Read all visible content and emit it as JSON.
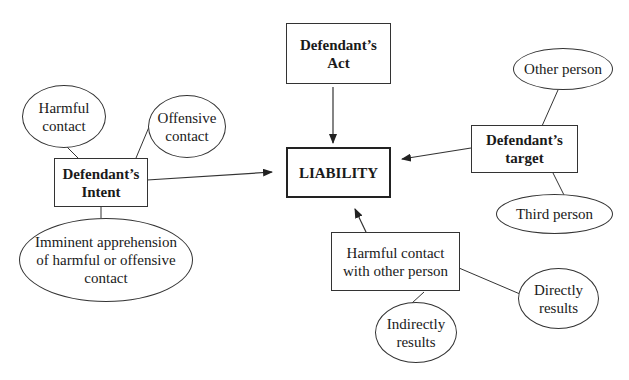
{
  "diagram": {
    "center": {
      "label": "LIABILITY"
    },
    "act": {
      "label": "Defendant’s\nAct"
    },
    "intent": {
      "label": "Defendant’s\nIntent"
    },
    "target": {
      "label": "Defendant’s\ntarget"
    },
    "contact": {
      "label": "Harmful contact\nwith other person"
    },
    "intent_options": [
      {
        "label": "Harmful\ncontact"
      },
      {
        "label": "Offensive\ncontact"
      },
      {
        "label": "Imminent apprehension\nof harmful or offensive\ncontact"
      }
    ],
    "target_options": [
      {
        "label": "Other person"
      },
      {
        "label": "Third person"
      }
    ],
    "contact_options": [
      {
        "label": "Directly\nresults"
      },
      {
        "label": "Indirectly\nresults"
      }
    ]
  }
}
